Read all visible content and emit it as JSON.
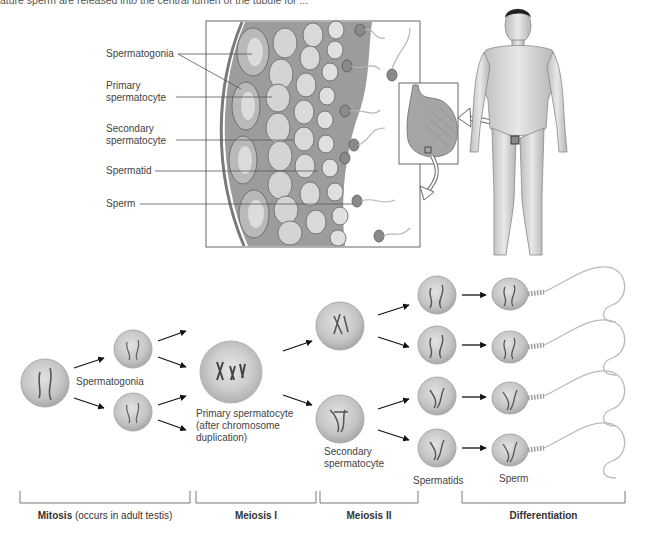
{
  "caption_fragment": "ature sperm are released into the central lumen of the tubule for ...",
  "tubule_labels": [
    {
      "id": "spermatogonia",
      "text": "Spermatogonia"
    },
    {
      "id": "primary",
      "line1": "Primary",
      "line2": "spermatocyte"
    },
    {
      "id": "secondary",
      "line1": "Secondary",
      "line2": "spermatocyte"
    },
    {
      "id": "spermatid",
      "text": "Spermatid"
    },
    {
      "id": "sperm",
      "text": "Sperm"
    }
  ],
  "process_labels": {
    "spermatogonia": "Spermatogonia",
    "primary_line1": "Primary spermatocyte",
    "primary_line2": "(after chromosome",
    "primary_line3": "duplication)",
    "secondary_line1": "Secondary",
    "secondary_line2": "spermatocyte",
    "spermatids": "Spermatids",
    "sperm": "Sperm"
  },
  "stages": [
    {
      "bold": "Mitosis",
      "rest": " (occurs in adult testis)"
    },
    {
      "bold": "Meiosis I",
      "rest": ""
    },
    {
      "bold": "Meiosis II",
      "rest": ""
    },
    {
      "bold": "Differentiation",
      "rest": ""
    }
  ],
  "colors": {
    "cell_fill": "#c8c8c8",
    "cell_edge": "#a9a9a9",
    "tubule_fill": "#9a9a9a",
    "arrow": "#111111",
    "line": "#555555"
  }
}
